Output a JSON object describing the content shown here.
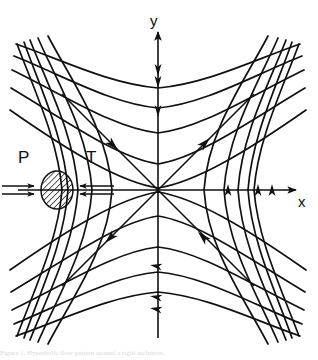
{
  "figure": {
    "type": "vector-field-diagram",
    "background_color": "#ffffff",
    "stroke_color": "#111111",
    "stroke_width": 1.6,
    "origin": {
      "x": 158,
      "y": 190
    },
    "axes": {
      "x": {
        "label": "x",
        "label_position": {
          "x": 300,
          "y": 202
        },
        "start": {
          "x": 18,
          "y": 190
        },
        "end": {
          "x": 296,
          "y": 190
        },
        "arrow_at_end": true
      },
      "y": {
        "label": "y",
        "label_position": {
          "x": 152,
          "y": 22
        },
        "start": {
          "x": 158,
          "y": 338
        },
        "end": {
          "x": 158,
          "y": 32
        },
        "arrow_at_end": true
      }
    },
    "force_labels": [
      {
        "name": "P",
        "text": "P",
        "x": 20,
        "y": 158,
        "meaning": "compression-arrow-label"
      },
      {
        "name": "T",
        "text": "T",
        "x": 86,
        "y": 158,
        "meaning": "tension-arrow-label"
      }
    ],
    "inclusion": {
      "name": "hatched-ellipse",
      "cx": 57,
      "cy": 190,
      "rx": 16,
      "ry": 19,
      "hatch_angle_deg": 45,
      "hatch_spacing": 3
    },
    "double_arrows": [
      {
        "name": "compression-arrow-left",
        "from_x": 2,
        "to_x": 40,
        "y": 190,
        "direction": "right",
        "pair_offset": 4
      },
      {
        "name": "compression-arrow-right",
        "from_x": 112,
        "to_x": 74,
        "y": 190,
        "direction": "left",
        "pair_offset": 4
      }
    ],
    "asymptotes": [
      {
        "name": "asymptote-upper-left",
        "x1": 62,
        "y1": 94,
        "x2": 158,
        "y2": 190,
        "arrow": "toward-origin",
        "arrow_t": 0.52
      },
      {
        "name": "asymptote-upper-right",
        "x1": 158,
        "y1": 190,
        "x2": 254,
        "y2": 94,
        "arrow": "away-origin",
        "arrow_t": 0.52
      },
      {
        "name": "asymptote-lower-left",
        "x1": 158,
        "y1": 190,
        "x2": 62,
        "y2": 286,
        "arrow": "away-origin",
        "arrow_t": 0.52
      },
      {
        "name": "asymptote-lower-right",
        "x1": 254,
        "y1": 286,
        "x2": 158,
        "y2": 190,
        "arrow": "toward-origin",
        "arrow_t": 0.52
      }
    ],
    "hyperbola_family": {
      "description": "xy = const streamlines of a pure-shear / saddle flow",
      "constants": [
        520,
        1150,
        2000,
        3100,
        4500
      ],
      "quadrant_sets": [
        "top",
        "bottom",
        "left",
        "right"
      ],
      "curve_count_per_set": 5
    },
    "flow_arrowheads": {
      "y_axis_upper": {
        "count": 3,
        "direction": "down",
        "y_positions": [
          70,
          82,
          111
        ]
      },
      "y_axis_lower": {
        "count": 3,
        "direction": "left",
        "y_positions": [
          266,
          297,
          309
        ]
      },
      "x_axis_right": {
        "count": 3,
        "direction": "up",
        "x_positions": [
          228,
          258,
          272
        ]
      }
    }
  },
  "caption": {
    "text": "Figure 1. Hyperbolic flow pattern around a rigid inclusion."
  }
}
